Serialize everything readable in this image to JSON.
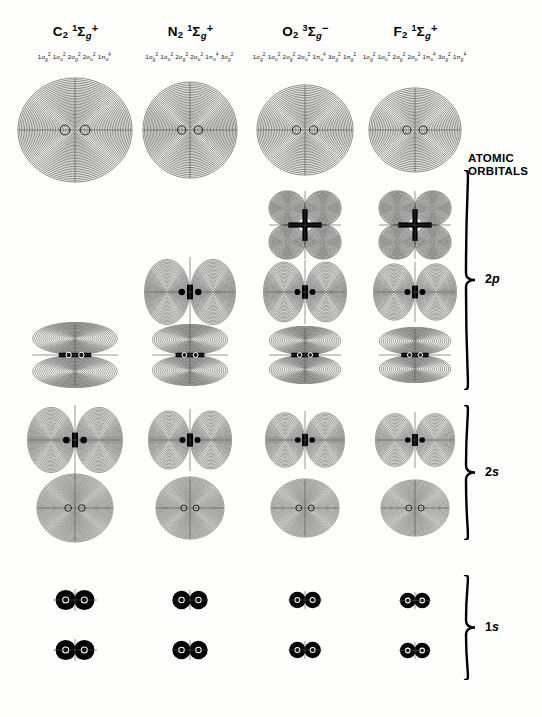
{
  "figure": {
    "title_visible": false,
    "background": "#fdfdfb",
    "ink": "#000000"
  },
  "columns": [
    {
      "id": "c2",
      "formula": "C",
      "subscript": "2",
      "term_multiplicity": "1",
      "term_symbol": "Σ",
      "term_gu": "g",
      "term_charge": "+",
      "configuration": [
        {
          "n": "1",
          "sym": "σ",
          "gu": "g",
          "occ": "2"
        },
        {
          "n": "1",
          "sym": "σ",
          "gu": "u",
          "occ": "2"
        },
        {
          "n": "2",
          "sym": "σ",
          "gu": "g",
          "occ": "2"
        },
        {
          "n": "2",
          "sym": "σ",
          "gu": "u",
          "occ": "2"
        },
        {
          "n": "1",
          "sym": "π",
          "gu": "u",
          "occ": "4"
        }
      ]
    },
    {
      "id": "n2",
      "formula": "N",
      "subscript": "2",
      "term_multiplicity": "1",
      "term_symbol": "Σ",
      "term_gu": "g",
      "term_charge": "+",
      "configuration": [
        {
          "n": "1",
          "sym": "σ",
          "gu": "g",
          "occ": "2"
        },
        {
          "n": "1",
          "sym": "σ",
          "gu": "u",
          "occ": "2"
        },
        {
          "n": "2",
          "sym": "σ",
          "gu": "g",
          "occ": "2"
        },
        {
          "n": "2",
          "sym": "σ",
          "gu": "u",
          "occ": "2"
        },
        {
          "n": "1",
          "sym": "π",
          "gu": "u",
          "occ": "4"
        },
        {
          "n": "3",
          "sym": "σ",
          "gu": "g",
          "occ": "2"
        }
      ]
    },
    {
      "id": "o2",
      "formula": "O",
      "subscript": "2",
      "term_multiplicity": "3",
      "term_symbol": "Σ",
      "term_gu": "g",
      "term_charge": "−",
      "configuration": [
        {
          "n": "1",
          "sym": "σ",
          "gu": "g",
          "occ": "2"
        },
        {
          "n": "1",
          "sym": "σ",
          "gu": "u",
          "occ": "2"
        },
        {
          "n": "2",
          "sym": "σ",
          "gu": "g",
          "occ": "2"
        },
        {
          "n": "2",
          "sym": "σ",
          "gu": "u",
          "occ": "2"
        },
        {
          "n": "1",
          "sym": "π",
          "gu": "u",
          "occ": "4"
        },
        {
          "n": "3",
          "sym": "σ",
          "gu": "g",
          "occ": "2"
        },
        {
          "n": "1",
          "sym": "π",
          "gu": "g",
          "occ": "2"
        }
      ]
    },
    {
      "id": "f2",
      "formula": "F",
      "subscript": "2",
      "term_multiplicity": "1",
      "term_symbol": "Σ",
      "term_gu": "g",
      "term_charge": "+",
      "configuration": [
        {
          "n": "1",
          "sym": "σ",
          "gu": "g",
          "occ": "2"
        },
        {
          "n": "1",
          "sym": "σ",
          "gu": "u",
          "occ": "2"
        },
        {
          "n": "2",
          "sym": "σ",
          "gu": "g",
          "occ": "2"
        },
        {
          "n": "2",
          "sym": "σ",
          "gu": "u",
          "occ": "2"
        },
        {
          "n": "1",
          "sym": "π",
          "gu": "u",
          "occ": "4"
        },
        {
          "n": "3",
          "sym": "σ",
          "gu": "g",
          "occ": "2"
        },
        {
          "n": "1",
          "sym": "π",
          "gu": "g",
          "occ": "4"
        }
      ]
    }
  ],
  "side_labels": {
    "atomic_orbitals_line1": "ATOMIC",
    "atomic_orbitals_line2": "ORBITALS",
    "groups": [
      {
        "id": "2p",
        "prefix": "2",
        "italic": "p"
      },
      {
        "id": "2s",
        "prefix": "2",
        "italic": "s"
      },
      {
        "id": "1s",
        "prefix": "1",
        "italic": "s"
      }
    ]
  },
  "chart_data": {
    "type": "contour-grid",
    "columns": [
      "C2",
      "N2",
      "O2",
      "F2"
    ],
    "rows": [
      {
        "row": 1,
        "orbital": "3σg",
        "group": "2p",
        "shape": "concentric-oval"
      },
      {
        "row": 2,
        "orbital": "1πg",
        "group": "2p",
        "shape": "four-lobe"
      },
      {
        "row": 3,
        "orbital": "3σu",
        "group": "2p",
        "shape": "two-lobe-horizontal"
      },
      {
        "row": 4,
        "orbital": "1πu",
        "group": "2p",
        "shape": "two-lobe-vertical"
      },
      {
        "row": 5,
        "orbital": "2σu",
        "group": "2s",
        "shape": "two-lobe-horizontal-split"
      },
      {
        "row": 6,
        "orbital": "2σg",
        "group": "2s",
        "shape": "concentric-oval-dense"
      },
      {
        "row": 7,
        "orbital": "1σu",
        "group": "1s",
        "shape": "core-pair"
      },
      {
        "row": 8,
        "orbital": "1σg",
        "group": "1s",
        "shape": "core-pair"
      }
    ],
    "cells": [
      {
        "col": "C2",
        "row": 1,
        "present": true,
        "shape": "concentric-oval",
        "w": 118,
        "h": 108
      },
      {
        "col": "N2",
        "row": 1,
        "present": true,
        "shape": "concentric-oval",
        "w": 98,
        "h": 100
      },
      {
        "col": "O2",
        "row": 1,
        "present": true,
        "shape": "concentric-oval",
        "w": 100,
        "h": 94
      },
      {
        "col": "F2",
        "row": 1,
        "present": true,
        "shape": "concentric-oval",
        "w": 96,
        "h": 88
      },
      {
        "col": "C2",
        "row": 2,
        "present": false
      },
      {
        "col": "N2",
        "row": 2,
        "present": false
      },
      {
        "col": "O2",
        "row": 2,
        "present": true,
        "shape": "four-lobe",
        "w": 76,
        "h": 72
      },
      {
        "col": "F2",
        "row": 2,
        "present": true,
        "shape": "four-lobe",
        "w": 76,
        "h": 72
      },
      {
        "col": "C2",
        "row": 3,
        "present": false
      },
      {
        "col": "N2",
        "row": 3,
        "present": true,
        "shape": "two-lobe-horizontal",
        "w": 92,
        "h": 74
      },
      {
        "col": "O2",
        "row": 3,
        "present": true,
        "shape": "two-lobe-horizontal",
        "w": 84,
        "h": 68
      },
      {
        "col": "F2",
        "row": 3,
        "present": true,
        "shape": "two-lobe-horizontal",
        "w": 84,
        "h": 64
      },
      {
        "col": "C2",
        "row": 4,
        "present": true,
        "shape": "two-lobe-vertical",
        "w": 90,
        "h": 66
      },
      {
        "col": "N2",
        "row": 4,
        "present": true,
        "shape": "two-lobe-vertical",
        "w": 80,
        "h": 62
      },
      {
        "col": "O2",
        "row": 4,
        "present": true,
        "shape": "two-lobe-vertical",
        "w": 76,
        "h": 58
      },
      {
        "col": "F2",
        "row": 4,
        "present": true,
        "shape": "two-lobe-vertical",
        "w": 76,
        "h": 56
      },
      {
        "col": "C2",
        "row": 5,
        "present": true,
        "shape": "two-lobe-horizontal",
        "w": 96,
        "h": 74
      },
      {
        "col": "N2",
        "row": 5,
        "present": true,
        "shape": "two-lobe-horizontal",
        "w": 84,
        "h": 66
      },
      {
        "col": "O2",
        "row": 5,
        "present": true,
        "shape": "two-lobe-horizontal",
        "w": 80,
        "h": 62
      },
      {
        "col": "F2",
        "row": 5,
        "present": true,
        "shape": "two-lobe-horizontal",
        "w": 80,
        "h": 60
      },
      {
        "col": "C2",
        "row": 6,
        "present": true,
        "shape": "concentric-oval-dense",
        "w": 80,
        "h": 72
      },
      {
        "col": "N2",
        "row": 6,
        "present": true,
        "shape": "concentric-oval-dense",
        "w": 72,
        "h": 66
      },
      {
        "col": "O2",
        "row": 6,
        "present": true,
        "shape": "concentric-oval-dense",
        "w": 72,
        "h": 62
      },
      {
        "col": "F2",
        "row": 6,
        "present": true,
        "shape": "concentric-oval-dense",
        "w": 72,
        "h": 60
      },
      {
        "col": "C2",
        "row": 7,
        "present": true,
        "shape": "core-pair",
        "w": 44,
        "h": 22
      },
      {
        "col": "N2",
        "row": 7,
        "present": true,
        "shape": "core-pair",
        "w": 36,
        "h": 20
      },
      {
        "col": "O2",
        "row": 7,
        "present": true,
        "shape": "core-pair",
        "w": 34,
        "h": 18
      },
      {
        "col": "F2",
        "row": 7,
        "present": true,
        "shape": "core-pair",
        "w": 32,
        "h": 17
      },
      {
        "col": "C2",
        "row": 8,
        "present": true,
        "shape": "core-pair",
        "w": 44,
        "h": 22
      },
      {
        "col": "N2",
        "row": 8,
        "present": true,
        "shape": "core-pair",
        "w": 36,
        "h": 20
      },
      {
        "col": "O2",
        "row": 8,
        "present": true,
        "shape": "core-pair",
        "w": 34,
        "h": 18
      },
      {
        "col": "F2",
        "row": 8,
        "present": true,
        "shape": "core-pair",
        "w": 32,
        "h": 17
      }
    ],
    "column_centers_px": [
      75,
      190,
      305,
      415
    ],
    "row_centers_px": [
      130,
      225,
      292,
      355,
      440,
      508,
      600,
      650
    ],
    "braces": [
      {
        "label": "2p",
        "top_px": 170,
        "bottom_px": 390
      },
      {
        "label": "2s",
        "top_px": 405,
        "bottom_px": 540
      },
      {
        "label": "1s",
        "top_px": 575,
        "bottom_px": 680
      }
    ]
  }
}
